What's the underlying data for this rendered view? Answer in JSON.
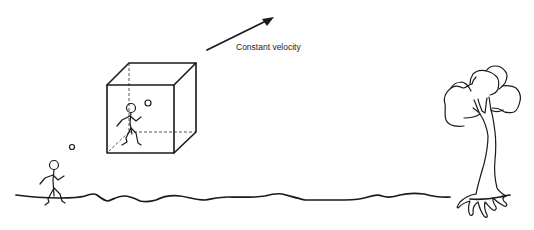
{
  "diagram": {
    "arrow_label": "Constant velocity",
    "elements": {
      "moving_box": {
        "name": "cube",
        "figure": "stick-figure-in-box",
        "ball": "ball"
      },
      "ground_figure": {
        "name": "stick-figure-on-ground",
        "ball": "ball"
      },
      "ground": "wavy-ground-line",
      "tree": "tree"
    },
    "colors": {
      "stroke": "#1a1a1a",
      "dashed": "#555555",
      "background": "#ffffff"
    }
  }
}
